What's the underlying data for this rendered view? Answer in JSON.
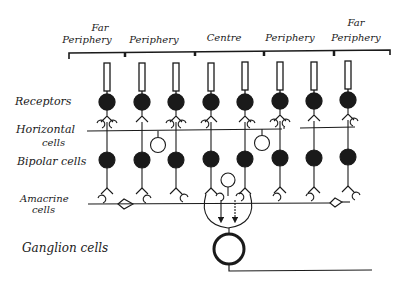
{
  "diagram": {
    "regions": [
      {
        "label_line1": "Far",
        "label_line2": "Periphery"
      },
      {
        "label_line1": "",
        "label_line2": "Periphery"
      },
      {
        "label_line1": "",
        "label_line2": "Centre"
      },
      {
        "label_line1": "",
        "label_line2": "Periphery"
      },
      {
        "label_line1": "Far",
        "label_line2": "Periphery"
      }
    ],
    "layers": {
      "receptors": "Receptors",
      "horizontal_line1": "Horizontal",
      "horizontal_line2": "cells",
      "bipolar": "Bipolar cells",
      "amacrine_line1": "Amacrine",
      "amacrine_line2": "cells",
      "ganglion": "Ganglion cells"
    },
    "columns": 8,
    "colors": {
      "ink": "#1a1a1a",
      "background": "#ffffff"
    }
  }
}
